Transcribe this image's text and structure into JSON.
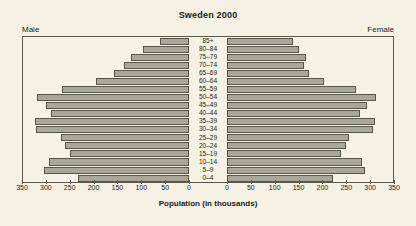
{
  "chart_data": {
    "type": "bar",
    "subtype": "population-pyramid",
    "title": "Sweden 2000",
    "xlabel": "Population (in thousands)",
    "ylabel": "",
    "grid": false,
    "legend_position": "top-corners",
    "left_side_label": "Male",
    "right_side_label": "Female",
    "xlim_left": [
      350,
      0
    ],
    "xlim_right": [
      0,
      350
    ],
    "xticks_left": [
      "350",
      "300",
      "250",
      "200",
      "150",
      "100",
      "50",
      "0"
    ],
    "xticks_right": [
      "0",
      "50",
      "100",
      "150",
      "200",
      "250",
      "300",
      "350"
    ],
    "tick_values": [
      350,
      300,
      250,
      200,
      150,
      100,
      50,
      0
    ],
    "categories": [
      "85+",
      "80–84",
      "75–79",
      "70–74",
      "65–69",
      "60–64",
      "55–59",
      "50–54",
      "45–49",
      "40–44",
      "35–39",
      "30–34",
      "25–29",
      "20–24",
      "15–19",
      "10–14",
      "5–9",
      "0–4"
    ],
    "series": [
      {
        "name": "Male",
        "side": "left",
        "values": [
          62,
          96,
          122,
          137,
          158,
          197,
          267,
          320,
          301,
          290,
          325,
          322,
          270,
          262,
          251,
          295,
          305,
          235
        ]
      },
      {
        "name": "Female",
        "side": "right",
        "values": [
          139,
          152,
          167,
          163,
          172,
          205,
          272,
          315,
          295,
          281,
          312,
          307,
          257,
          250,
          240,
          285,
          290,
          224
        ]
      }
    ],
    "colors": {
      "bar_fill": "#a8a89a",
      "bar_stroke": "#55554a",
      "background": "#f5f2e4",
      "axis": "#58584a",
      "text": "#1a1a1a"
    }
  }
}
